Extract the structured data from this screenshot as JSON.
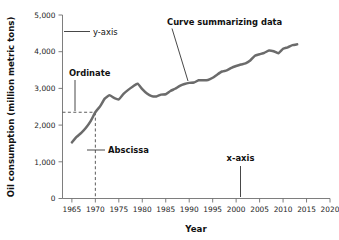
{
  "chart_data": {
    "type": "line",
    "title": "",
    "xlabel": "Year",
    "ylabel": "Oil consumption (million metric tons)",
    "xlim": [
      1963,
      2020
    ],
    "ylim": [
      0,
      5000
    ],
    "xticks": [
      1965,
      1970,
      1975,
      1980,
      1985,
      1990,
      1995,
      2000,
      2005,
      2010,
      2015,
      2020
    ],
    "xtick_labels": [
      "1965",
      "1970",
      "1975",
      "1980",
      "1985",
      "1990",
      "1995",
      "2000",
      "2005",
      "2010",
      "2015",
      "2020"
    ],
    "yticks": [
      0,
      1000,
      2000,
      3000,
      4000,
      5000
    ],
    "ytick_labels": [
      "0",
      "1,000",
      "2,000",
      "3,000",
      "4,000",
      "5,000"
    ],
    "grid": false,
    "legend": "none",
    "series": [
      {
        "name": "Oil consumption",
        "color": "#6b6b6b",
        "x": [
          1965,
          1966,
          1967,
          1968,
          1969,
          1970,
          1971,
          1972,
          1973,
          1974,
          1975,
          1976,
          1977,
          1978,
          1979,
          1980,
          1981,
          1982,
          1983,
          1984,
          1985,
          1986,
          1987,
          1988,
          1989,
          1990,
          1991,
          1992,
          1993,
          1994,
          1995,
          1996,
          1997,
          1998,
          1999,
          2000,
          2001,
          2002,
          2003,
          2004,
          2005,
          2006,
          2007,
          2008,
          2009,
          2010,
          2011,
          2012,
          2013
        ],
        "y": [
          1530,
          1680,
          1790,
          1930,
          2110,
          2350,
          2510,
          2720,
          2810,
          2740,
          2700,
          2850,
          2960,
          3050,
          3130,
          2980,
          2860,
          2790,
          2780,
          2830,
          2840,
          2930,
          2990,
          3070,
          3120,
          3150,
          3160,
          3220,
          3220,
          3230,
          3290,
          3380,
          3460,
          3490,
          3560,
          3610,
          3650,
          3680,
          3760,
          3890,
          3930,
          3970,
          4030,
          4010,
          3960,
          4080,
          4120,
          4180,
          4200
        ]
      }
    ],
    "annotations": [
      {
        "name": "y-axis",
        "label": "y-axis",
        "leader": "horizontal",
        "points_to": "y-axis line"
      },
      {
        "name": "x-axis",
        "label": "x-axis",
        "leader": "vertical",
        "points_to": "x-axis line near 2003"
      },
      {
        "name": "ordinate",
        "label": "Ordinate",
        "leader": "vertical",
        "points_to": "horizontal dashed line at y = 2350"
      },
      {
        "name": "abscissa",
        "label": "Abscissa",
        "leader": "horizontal",
        "points_to": "vertical dashed line at x = 1970"
      },
      {
        "name": "curve-summarizing-data",
        "label": "Curve summarizing data",
        "leader": "diagonal",
        "points_to": "the plotted curve near 1988"
      }
    ],
    "guides": {
      "ordinate_value": 2350,
      "abscissa_value": 1970
    },
    "colors": {
      "curve": "#6b6b6b",
      "axis": "#6f6f6f",
      "text": "#111111",
      "guide": "#4a4a4a",
      "background": "#ffffff"
    }
  }
}
